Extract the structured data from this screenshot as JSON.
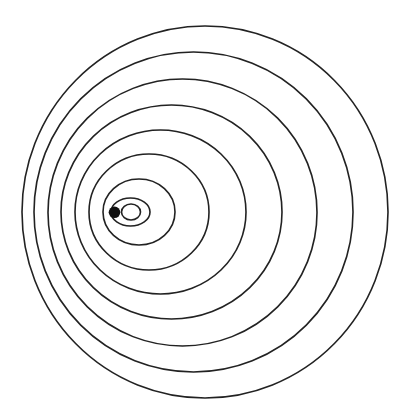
{
  "diagram": {
    "type": "nested-circles",
    "stroke_color": "#222222",
    "background": "#ffffff",
    "point": {
      "cx": 114.5,
      "cy": 212.3,
      "r": 5.8,
      "color": "#111111"
    },
    "rings": [
      {
        "cx": 205.0,
        "cy": 212.0,
        "rx": 183.0,
        "ry": 186.0
      },
      {
        "cx": 193.5,
        "cy": 212.0,
        "rx": 159.5,
        "ry": 160.0
      },
      {
        "cx": 182.5,
        "cy": 212.5,
        "rx": 134.5,
        "ry": 133.5
      },
      {
        "cx": 171.5,
        "cy": 212.0,
        "rx": 110.5,
        "ry": 107.0
      },
      {
        "cx": 160.5,
        "cy": 212.0,
        "rx": 85.5,
        "ry": 82.0
      },
      {
        "cx": 149.0,
        "cy": 212.0,
        "rx": 60.0,
        "ry": 58.0
      },
      {
        "cx": 139.0,
        "cy": 212.0,
        "rx": 36.0,
        "ry": 33.0
      },
      {
        "cx": 130.5,
        "cy": 212.0,
        "rx": 19.5,
        "ry": 14.0
      },
      {
        "cx": 131.0,
        "cy": 212.0,
        "rx": 9.5,
        "ry": 8.0
      }
    ]
  }
}
